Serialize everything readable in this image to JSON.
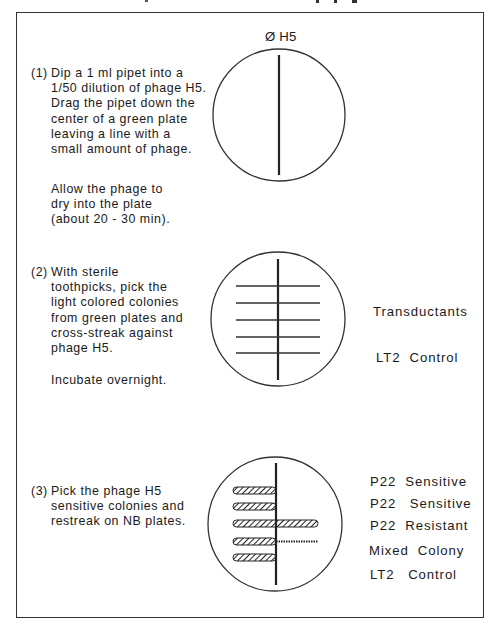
{
  "frame": {
    "border_color": "#333333"
  },
  "plate1": {
    "label": "Ø H5"
  },
  "steps": [
    {
      "number": "(1)",
      "lines": "Dip a 1 ml pipet into a\n1/50 dilution of phage H5.\nDrag the pipet down the\ncenter of a green plate\nleaving a line with a\nsmall amount of phage."
    },
    {
      "number": "(2)",
      "lines": "With sterile\ntoothpicks, pick the\nlight colored colonies\nfrom green plates and\ncross-streak against\nphage H5."
    },
    {
      "number": "(3)",
      "lines": "Pick the phage H5\nsensitive colonies and\nrestreak on NB plates."
    }
  ],
  "notes": {
    "allow_dry": "Allow the phage to\ndry into the plate\n(about 20 - 30 min).",
    "incubate": "Incubate overnight."
  },
  "plate2": {
    "labels": {
      "transductants": "Transductants",
      "control": "LT2  Control"
    }
  },
  "plate3": {
    "labels": [
      "P22  Sensitive",
      "P22   Sensitive",
      "P22  Resistant",
      "Mixed  Colony",
      "LT2   Control"
    ]
  }
}
